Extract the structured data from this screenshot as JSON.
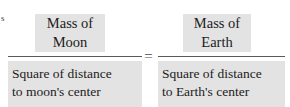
{
  "figure": {
    "type": "equation-figure",
    "margin_text": "s",
    "colors": {
      "highlight_background": "#e3e3e3",
      "text": "#1c1c1c",
      "fraction_bar": "#5a5a5a",
      "page_background": "#ffffff"
    },
    "operator": "=",
    "left_fraction": {
      "numerator": "Mass of\nMoon",
      "numerator_line_1": "Mass of",
      "numerator_line_2": "Moon",
      "denominator": "Square of distance\nto moon's center",
      "denominator_line_1": "Square of distance",
      "denominator_line_2": "to moon's center"
    },
    "right_fraction": {
      "numerator": "Mass of\nEarth",
      "numerator_line_1": "Mass of",
      "numerator_line_2": "Earth",
      "denominator": "Square of distance\nto Earth's center",
      "denominator_line_1": "Square of distance",
      "denominator_line_2": "to Earth's center"
    }
  }
}
